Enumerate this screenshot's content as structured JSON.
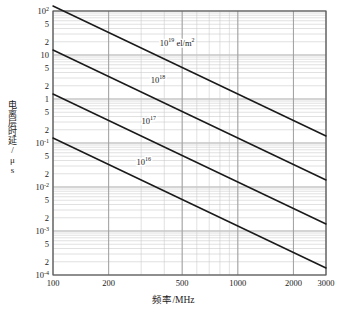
{
  "chart_data": {
    "type": "line",
    "title": "",
    "xlabel": "频率/MHz",
    "ylabel": "电离层时延/μs",
    "xscale": "log",
    "yscale": "log",
    "xlim": [
      100,
      3000
    ],
    "ylim": [
      0.0001,
      100
    ],
    "grid": true,
    "legend_position": "inline-labels",
    "xticks": [
      {
        "value": 100,
        "label": "100"
      },
      {
        "value": 200,
        "label": "200"
      },
      {
        "value": 500,
        "label": "500"
      },
      {
        "value": 1000,
        "label": "1000"
      },
      {
        "value": 2000,
        "label": "2000"
      },
      {
        "value": 3000,
        "label": "3000"
      }
    ],
    "yticks": [
      {
        "value": 100,
        "label": "10",
        "exponent": "2"
      },
      {
        "value": 50,
        "label": "5",
        "exponent": ""
      },
      {
        "value": 20,
        "label": "2",
        "exponent": ""
      },
      {
        "value": 10,
        "label": "10",
        "exponent": ""
      },
      {
        "value": 5,
        "label": "5",
        "exponent": ""
      },
      {
        "value": 2,
        "label": "2",
        "exponent": ""
      },
      {
        "value": 1,
        "label": "1",
        "exponent": ""
      },
      {
        "value": 0.5,
        "label": "5",
        "exponent": ""
      },
      {
        "value": 0.2,
        "label": "2",
        "exponent": ""
      },
      {
        "value": 0.1,
        "label": "10",
        "exponent": "-1"
      },
      {
        "value": 0.05,
        "label": "5",
        "exponent": ""
      },
      {
        "value": 0.02,
        "label": "2",
        "exponent": ""
      },
      {
        "value": 0.01,
        "label": "10",
        "exponent": "-2"
      },
      {
        "value": 0.005,
        "label": "5",
        "exponent": ""
      },
      {
        "value": 0.002,
        "label": "2",
        "exponent": ""
      },
      {
        "value": 0.001,
        "label": "10",
        "exponent": "-3"
      },
      {
        "value": 0.0005,
        "label": "5",
        "exponent": ""
      },
      {
        "value": 0.0002,
        "label": "2",
        "exponent": ""
      },
      {
        "value": 0.0001,
        "label": "10",
        "exponent": "-4"
      }
    ],
    "series": [
      {
        "name": "TEC 1e19",
        "label_base": "10",
        "label_exponent": "19",
        "label_unit": "el/m",
        "label_unit_exponent": "2",
        "slope": -2,
        "x": [
          100,
          3000
        ],
        "y": [
          130,
          0.1444
        ]
      },
      {
        "name": "TEC 1e18",
        "label_base": "10",
        "label_exponent": "18",
        "label_unit": "",
        "label_unit_exponent": "",
        "slope": -2,
        "x": [
          100,
          3000
        ],
        "y": [
          13,
          0.01444
        ]
      },
      {
        "name": "TEC 1e17",
        "label_base": "10",
        "label_exponent": "17",
        "label_unit": "",
        "label_unit_exponent": "",
        "slope": -2,
        "x": [
          100,
          3000
        ],
        "y": [
          1.3,
          0.001444
        ]
      },
      {
        "name": "TEC 1e16",
        "label_base": "10",
        "label_exponent": "16",
        "label_unit": "",
        "label_unit_exponent": "",
        "slope": -2,
        "x": [
          100,
          3000
        ],
        "y": [
          0.13,
          0.0001444
        ]
      }
    ],
    "annotations": [
      {
        "text": "10",
        "sup": "19",
        "unit": "el/m",
        "unit_sup": "2",
        "x": 470,
        "y": 18
      },
      {
        "text": "10",
        "sup": "18",
        "unit": "",
        "unit_sup": "",
        "x": 370,
        "y": 2.6
      },
      {
        "text": "10",
        "sup": "17",
        "unit": "",
        "unit_sup": "",
        "x": 330,
        "y": 0.3
      },
      {
        "text": "10",
        "sup": "16",
        "unit": "",
        "unit_sup": "",
        "x": 310,
        "y": 0.035
      }
    ],
    "colors": {
      "line": "#1a1a1a",
      "grid_major": "#9a9a9a",
      "grid_minor": "#c8c8c8",
      "axis": "#555555",
      "background": "#ffffff"
    }
  }
}
